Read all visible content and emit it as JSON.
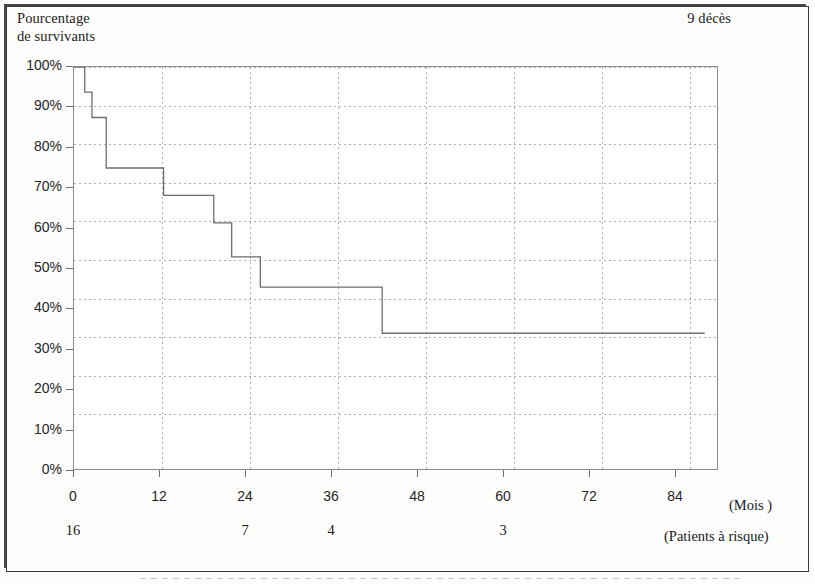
{
  "header": {
    "y_axis_title": "Pourcentage\nde survivants",
    "deaths_label": "9 décès"
  },
  "captions": {
    "months": "(Mois )",
    "at_risk": "(Patients à risque)"
  },
  "chart_data": {
    "type": "line",
    "subtype": "kaplan-meier-step",
    "title": "Pourcentage de survivants",
    "xlabel": "(Mois )",
    "ylabel": "Pourcentage de survivants",
    "xlim": [
      0,
      90
    ],
    "ylim": [
      0,
      100
    ],
    "grid": true,
    "legend": null,
    "annotations": [
      "9 décès"
    ],
    "x_ticks": [
      0,
      12,
      24,
      36,
      48,
      60,
      72,
      84
    ],
    "x_tick_labels": [
      "0",
      "12",
      "24",
      "36",
      "48",
      "60",
      "72",
      "84"
    ],
    "y_ticks": [
      0,
      10,
      20,
      30,
      40,
      50,
      60,
      70,
      80,
      90,
      100
    ],
    "y_tick_labels": [
      "0%",
      "10%",
      "20%",
      "30%",
      "40%",
      "50%",
      "60%",
      "70%",
      "80%",
      "90%",
      "100%"
    ],
    "series": [
      {
        "name": "Survie globale",
        "step_points": [
          {
            "month": 0,
            "survival": 100
          },
          {
            "month": 1.5,
            "survival": 100
          },
          {
            "month": 1.5,
            "survival": 93.8
          },
          {
            "month": 2.5,
            "survival": 93.8
          },
          {
            "month": 2.5,
            "survival": 87.5
          },
          {
            "month": 4.5,
            "survival": 87.5
          },
          {
            "month": 4.5,
            "survival": 75.0
          },
          {
            "month": 12.5,
            "survival": 75.0
          },
          {
            "month": 12.5,
            "survival": 68.2
          },
          {
            "month": 19.5,
            "survival": 68.2
          },
          {
            "month": 19.5,
            "survival": 61.4
          },
          {
            "month": 22.0,
            "survival": 61.4
          },
          {
            "month": 22.0,
            "survival": 53.0
          },
          {
            "month": 26.0,
            "survival": 53.0
          },
          {
            "month": 26.0,
            "survival": 45.5
          },
          {
            "month": 43.0,
            "survival": 45.5
          },
          {
            "month": 43.0,
            "survival": 34.1
          },
          {
            "month": 88.0,
            "survival": 34.1
          }
        ]
      }
    ],
    "at_risk": {
      "label": "(Patients à risque)",
      "months": [
        0,
        24,
        36,
        60
      ],
      "counts": [
        "16",
        "7",
        "4",
        "3"
      ]
    },
    "colors": {
      "curve": "#6e6e6e",
      "grid": "#a0a0a0",
      "axis": "#8d8d8d",
      "text": "#1a1a1a"
    }
  }
}
